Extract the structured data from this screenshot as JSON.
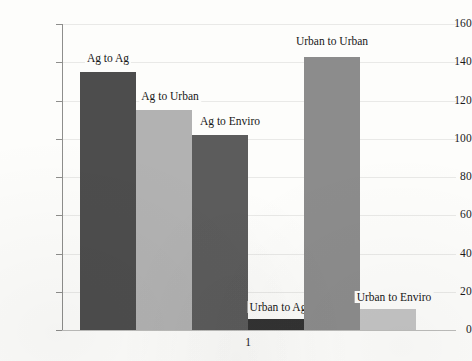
{
  "chart_data": {
    "type": "bar",
    "title": "",
    "xlabel": "",
    "ylabel": "",
    "categories": [
      "Ag to Ag",
      "Ag to Urban",
      "Ag to Enviro",
      "Urban to Ag",
      "Urban to Urban",
      "Urban to Enviro"
    ],
    "values": [
      135,
      115,
      102,
      6,
      143,
      11
    ],
    "bar_colors": [
      "#4d4d4d",
      "#b2b2b2",
      "#5c5c5c",
      "#333333",
      "#8c8c8c",
      "#c4c4c4"
    ],
    "ylim": [
      0,
      160
    ],
    "ytick_labels": [
      "0",
      "20",
      "40",
      "60",
      "80",
      "100",
      "120",
      "140",
      "160"
    ],
    "ytick_values": [
      0,
      20,
      40,
      60,
      80,
      100,
      120,
      140,
      160
    ],
    "xtick_labels": [
      "1"
    ],
    "grid": true,
    "legend": "none",
    "data_labels_position": "above-bar"
  }
}
